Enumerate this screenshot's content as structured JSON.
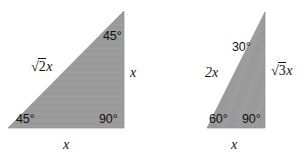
{
  "figure": {
    "shape_fill_color": "#9b9b9b",
    "shape_stroke_color": "#8e8e8e",
    "text_color": "#111111",
    "background_color": "#ffffff"
  },
  "triangles": [
    {
      "name": "isosceles-right-triangle",
      "type": "45-45-90",
      "labels": {
        "hypotenuse": {
          "radical": "2",
          "coefficient": "",
          "variable": "x",
          "text": "√2x"
        },
        "vertical_leg": {
          "text": "x"
        },
        "horizontal_leg": {
          "text": "x"
        },
        "angle_top": {
          "value": "45",
          "text": "45°"
        },
        "angle_bottom_left": {
          "value": "45",
          "text": "45°"
        },
        "angle_bottom_right": {
          "value": "90",
          "text": "90°"
        }
      }
    },
    {
      "name": "thirty-sixty-ninety-triangle",
      "type": "30-60-90",
      "labels": {
        "hypotenuse": {
          "text": "2x"
        },
        "vertical_leg": {
          "radical": "3",
          "coefficient": "",
          "variable": "x",
          "text": "√3x"
        },
        "horizontal_leg": {
          "text": "x"
        },
        "angle_top": {
          "value": "30",
          "text": "30°"
        },
        "angle_bottom_left": {
          "value": "60",
          "text": "60°"
        },
        "angle_bottom_right": {
          "value": "90",
          "text": "90°"
        }
      }
    }
  ],
  "degree_symbol": "°",
  "radical_symbol": "√"
}
